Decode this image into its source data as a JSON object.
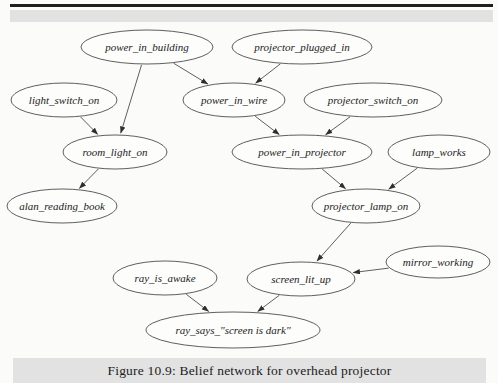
{
  "figure": {
    "caption": "Figure 10.9: Belief network for overhead projector"
  },
  "colors": {
    "background": "#fbfbfa",
    "band": "#e2e2e2",
    "top_rule": "#1f1f1f",
    "node_fill": "#fdfdfc",
    "node_stroke": "#4d4d4d",
    "edge": "#4d4d4d",
    "arrowhead": "#2f2f2f",
    "text": "#222222"
  },
  "diagram": {
    "type": "belief-network",
    "nodes": [
      {
        "id": "power_in_building",
        "label": "power_in_building",
        "cx": 147,
        "cy": 47,
        "rx": 66,
        "ry": 17
      },
      {
        "id": "projector_plugged_in",
        "label": "projector_plugged_in",
        "cx": 302,
        "cy": 47,
        "rx": 70,
        "ry": 17
      },
      {
        "id": "light_switch_on",
        "label": "light_switch_on",
        "cx": 64,
        "cy": 100,
        "rx": 53,
        "ry": 17
      },
      {
        "id": "power_in_wire",
        "label": "power_in_wire",
        "cx": 234,
        "cy": 100,
        "rx": 51,
        "ry": 17
      },
      {
        "id": "projector_switch_on",
        "label": "projector_switch_on",
        "cx": 373,
        "cy": 100,
        "rx": 69,
        "ry": 17
      },
      {
        "id": "room_light_on",
        "label": "room_light_on",
        "cx": 115,
        "cy": 152,
        "rx": 52,
        "ry": 17
      },
      {
        "id": "power_in_projector",
        "label": "power_in_projector",
        "cx": 302,
        "cy": 152,
        "rx": 70,
        "ry": 17
      },
      {
        "id": "lamp_works",
        "label": "lamp_works",
        "cx": 439,
        "cy": 152,
        "rx": 51,
        "ry": 17
      },
      {
        "id": "alan_reading_book",
        "label": "alan_reading_book",
        "cx": 62,
        "cy": 206,
        "rx": 55,
        "ry": 17
      },
      {
        "id": "projector_lamp_on",
        "label": "projector_lamp_on",
        "cx": 366,
        "cy": 206,
        "rx": 54,
        "ry": 17
      },
      {
        "id": "ray_is_awake",
        "label": "ray_is_awake",
        "cx": 165,
        "cy": 278,
        "rx": 52,
        "ry": 17
      },
      {
        "id": "screen_lit_up",
        "label": "screen_lit_up",
        "cx": 301,
        "cy": 279,
        "rx": 54,
        "ry": 17
      },
      {
        "id": "mirror_working",
        "label": "mirror_working",
        "cx": 438,
        "cy": 262,
        "rx": 52,
        "ry": 16
      },
      {
        "id": "ray_says_screen_is_dark",
        "label": "ray_says_\"screen is dark\"",
        "cx": 233,
        "cy": 330,
        "rx": 87,
        "ry": 18
      }
    ],
    "edges": [
      {
        "from": "power_in_building",
        "to": "power_in_wire"
      },
      {
        "from": "power_in_building",
        "to": "room_light_on"
      },
      {
        "from": "projector_plugged_in",
        "to": "power_in_wire"
      },
      {
        "from": "light_switch_on",
        "to": "room_light_on"
      },
      {
        "from": "power_in_wire",
        "to": "power_in_projector"
      },
      {
        "from": "projector_switch_on",
        "to": "power_in_projector"
      },
      {
        "from": "room_light_on",
        "to": "alan_reading_book"
      },
      {
        "from": "power_in_projector",
        "to": "projector_lamp_on"
      },
      {
        "from": "lamp_works",
        "to": "projector_lamp_on"
      },
      {
        "from": "projector_lamp_on",
        "to": "screen_lit_up"
      },
      {
        "from": "mirror_working",
        "to": "screen_lit_up"
      },
      {
        "from": "ray_is_awake",
        "to": "ray_says_screen_is_dark"
      },
      {
        "from": "screen_lit_up",
        "to": "ray_says_screen_is_dark"
      }
    ]
  }
}
